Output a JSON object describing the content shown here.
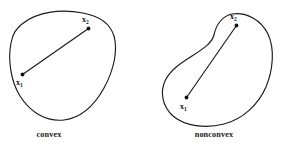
{
  "figure": {
    "background_color": "#ffffff",
    "stroke_color": "#1a1a1a",
    "dot_color": "#111111",
    "width": 285,
    "height": 148
  },
  "panels": [
    {
      "id": "convex",
      "caption": "convex",
      "caption_x": 49,
      "caption_y": 137,
      "points": [
        {
          "id": "x1",
          "symbol": "x",
          "subscript": "1",
          "dot_x": 22.5,
          "dot_y": 74.5,
          "label_x": 16,
          "label_y": 85
        },
        {
          "id": "x2",
          "symbol": "x",
          "subscript": "2",
          "dot_x": 88.5,
          "dot_y": 28.5,
          "label_x": 82,
          "label_y": 22
        }
      ],
      "boundary_path": "M 22 24 C 38 11 62 9 83 13 C 99 16 110 23 114 36 C 118 50 114 70 104 88 C 94 106 80 118 64 120 C 46 122 30 112 20 96 C 10 80 8 58 11 43 C 13 33 16 29 22 24 Z",
      "chord_path": "M 22.5 74.5 L 88.5 28.5",
      "chord_inside": true
    },
    {
      "id": "nonconvex",
      "caption": "nonconvex",
      "caption_x": 214,
      "caption_y": 137,
      "points": [
        {
          "id": "x1",
          "symbol": "x",
          "subscript": "1",
          "dot_x": 186.5,
          "dot_y": 97.5,
          "label_x": 180,
          "label_y": 109
        },
        {
          "id": "x2",
          "symbol": "x",
          "subscript": "2",
          "dot_x": 236.5,
          "dot_y": 25.5,
          "label_x": 230,
          "label_y": 19
        }
      ],
      "boundary_path": "M 232 14 C 247 12 261 20 268 34 C 275 49 273 70 266 87 C 258 105 243 119 224 124 C 205 129 185 126 173 116 C 162 106 160 92 165 81 C 170 70 181 63 192 56 C 203 49 212 43 214 35 C 216 25 222 16 232 14 Z",
      "chord_path": "M 186.5 97.5 L 236.5 25.5",
      "chord_inside": false
    }
  ]
}
